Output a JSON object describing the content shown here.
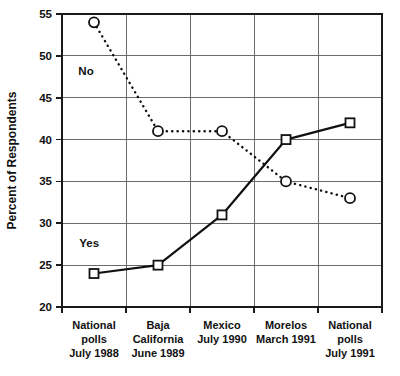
{
  "chart_data": {
    "type": "line",
    "title": "",
    "xlabel": "",
    "ylabel": "Percent of Respondents",
    "ylim": [
      20,
      55
    ],
    "yticks": [
      20,
      25,
      30,
      35,
      40,
      45,
      50,
      55
    ],
    "ytick_labels": [
      "20",
      "25",
      "30",
      "35",
      "40",
      "45",
      "50",
      "55"
    ],
    "grid": true,
    "legend_position": "inline-annotation",
    "categories": [
      "National polls July 1988",
      "Baja California June 1989",
      "Mexico July 1990",
      "Morelos March 1991",
      "National polls July 1991"
    ],
    "category_lines": [
      [
        "National",
        "polls",
        "July 1988"
      ],
      [
        "Baja",
        "California",
        "June 1989"
      ],
      [
        "Mexico",
        "July 1990"
      ],
      [
        "Morelos",
        "March 1991"
      ],
      [
        "National",
        "polls",
        "July 1991"
      ]
    ],
    "series": [
      {
        "name": "Yes",
        "values": [
          24,
          25,
          31,
          40,
          42
        ],
        "marker": "square",
        "linestyle": "solid",
        "color": "#111111"
      },
      {
        "name": "No",
        "values": [
          54,
          41,
          41,
          35,
          33
        ],
        "marker": "circle",
        "linestyle": "dotted",
        "color": "#111111"
      }
    ],
    "annotations": [
      {
        "text": "No",
        "x_frac": 0.075,
        "value": 48.2
      },
      {
        "text": "Yes",
        "x_frac": 0.085,
        "value": 27.6
      }
    ]
  }
}
